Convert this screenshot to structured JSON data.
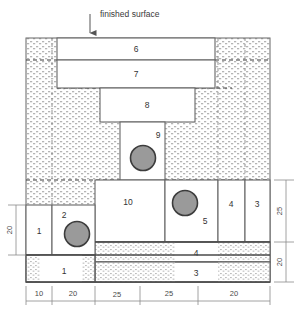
{
  "diagram": {
    "title": "finished surface",
    "annotation": {
      "text": "finished surface",
      "arrow": "down-arrow"
    },
    "colors": {
      "outline": "#555555",
      "block_line": "#666666",
      "circle_fill": "#9a9a9a",
      "circle_stroke": "#3c3c3c",
      "soil_stipple": "#b8b8b8",
      "background": "#ffffff"
    },
    "blocks": [
      {
        "id": "6",
        "label": "6"
      },
      {
        "id": "7",
        "label": "7"
      },
      {
        "id": "8",
        "label": "8"
      },
      {
        "id": "9",
        "label": "9"
      },
      {
        "id": "10",
        "label": "10"
      },
      {
        "id": "5",
        "label": "5"
      },
      {
        "id": "4r",
        "label": "4"
      },
      {
        "id": "3r",
        "label": "3"
      },
      {
        "id": "4m",
        "label": "4"
      },
      {
        "id": "3m",
        "label": "3"
      },
      {
        "id": "1l",
        "label": "1"
      },
      {
        "id": "2",
        "label": "2"
      },
      {
        "id": "1b",
        "label": "1"
      }
    ],
    "dimensions": {
      "bottom": {
        "label": "bottom-dimension-chain",
        "values": [
          "10",
          "20",
          "25",
          "25",
          "20"
        ]
      },
      "left": {
        "label": "left-dimension",
        "values": [
          "20"
        ]
      },
      "right": {
        "label": "right-dimension-chain",
        "values": [
          "25",
          "20"
        ]
      }
    }
  }
}
